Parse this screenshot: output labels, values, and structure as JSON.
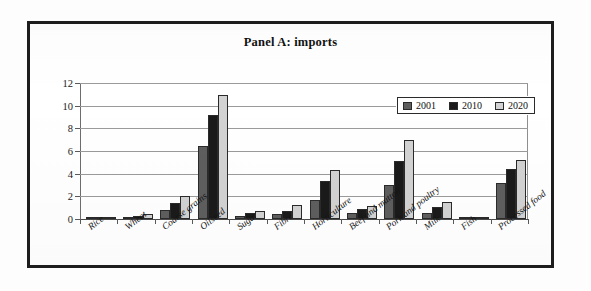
{
  "chart_data": {
    "type": "bar",
    "title": "Panel A:  imports",
    "xlabel": "",
    "ylabel": "",
    "ylim": [
      0,
      12
    ],
    "yticks": [
      0,
      2,
      4,
      6,
      8,
      10,
      12
    ],
    "grid": true,
    "legend_position": "top-right",
    "categories": [
      "Rice",
      "Wheat",
      "Coarse grains",
      "Oilseed",
      "Sugar",
      "Fibre",
      "Horticulture",
      "Beef and mutton",
      "Pork and poultry",
      "Milk",
      "Fish",
      "Processed food"
    ],
    "series": [
      {
        "name": "2001",
        "color": "#5e5e5e",
        "values": [
          0.1,
          0.2,
          0.8,
          6.45,
          0.3,
          0.4,
          1.65,
          0.5,
          3.0,
          0.5,
          0.15,
          3.15
        ]
      },
      {
        "name": "2010",
        "color": "#1a1a1a",
        "values": [
          0.15,
          0.3,
          1.45,
          9.15,
          0.5,
          0.7,
          3.35,
          0.9,
          5.15,
          1.05,
          0.15,
          4.45
        ]
      },
      {
        "name": "2020",
        "color": "#d2d2d2",
        "values": [
          0.15,
          0.45,
          2.05,
          10.9,
          0.75,
          1.25,
          4.35,
          1.15,
          7.0,
          1.5,
          0.1,
          5.2
        ]
      }
    ]
  },
  "figure": {
    "frame_color": "#1d1d1d",
    "background": "#ffffff"
  }
}
